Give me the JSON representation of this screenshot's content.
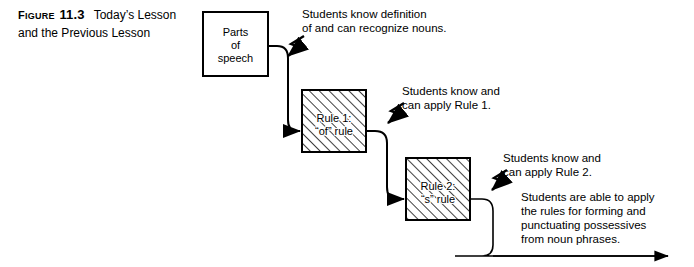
{
  "figure": {
    "label_word": "Figure",
    "label_word_caps": "F",
    "label_word_rest": "IGURE",
    "number": "11.3",
    "title_line1": "Today’s Lesson",
    "title_line2": "and the Previous Lesson"
  },
  "boxes": [
    {
      "id": "parts-of-speech",
      "line1": "Parts",
      "line2": "of",
      "line3": "speech",
      "hatched": false
    },
    {
      "id": "rule-1",
      "line1": "Rule 1:",
      "line2": "“of” rule",
      "line3": "",
      "hatched": true
    },
    {
      "id": "rule-2",
      "line1": "Rule 2:",
      "line2": "“s” rule",
      "line3": "",
      "hatched": true
    }
  ],
  "annotations": [
    {
      "id": "outcome-nouns",
      "line1": "Students know definition",
      "line2": "of and can recognize nouns.",
      "line3": "",
      "line4": ""
    },
    {
      "id": "outcome-rule-1",
      "line1": "Students know and",
      "line2": "can apply Rule 1.",
      "line3": "",
      "line4": ""
    },
    {
      "id": "outcome-rule-2",
      "line1": "Students know and",
      "line2": "can apply Rule 2.",
      "line3": "",
      "line4": ""
    },
    {
      "id": "outcome-possessives",
      "line1": "Students are able to apply",
      "line2": "the rules for forming and",
      "line3": "punctuating possessives",
      "line4": "from noun phrases."
    }
  ],
  "colors": {
    "ink": "#000000",
    "background": "#ffffff"
  }
}
